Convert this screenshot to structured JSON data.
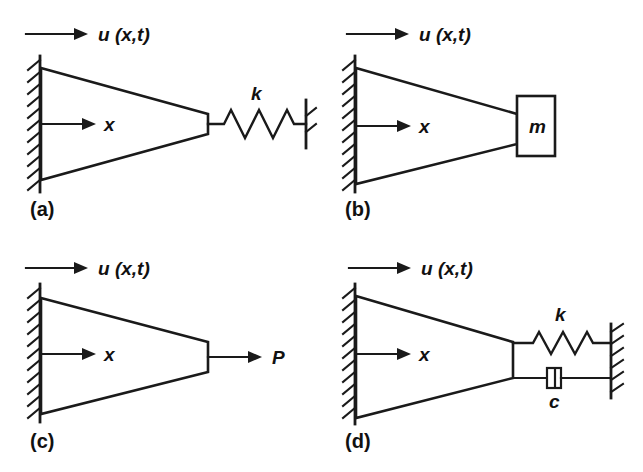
{
  "figure": {
    "background_color": "#ffffff",
    "line_color": "#1a1a1a",
    "panel_count": 4
  },
  "common": {
    "displacement_label": "u (x,t)",
    "axis_label": "x",
    "wall_name": "fixed-support-hatched-wall"
  },
  "panels": [
    {
      "id": "a",
      "caption": "(a)",
      "displacement_label": "u (x,t)",
      "axis_label": "x",
      "end_condition": "spring",
      "end_label": "k",
      "description": "Tapered bar fixed at left wall, spring of stiffness k connecting free end to ground"
    },
    {
      "id": "b",
      "caption": "(b)",
      "displacement_label": "u (x,t)",
      "axis_label": "x",
      "end_condition": "mass",
      "end_label": "m",
      "description": "Tapered bar fixed at left wall, lumped mass m attached at free end"
    },
    {
      "id": "c",
      "caption": "(c)",
      "displacement_label": "u (x,t)",
      "axis_label": "x",
      "end_condition": "force",
      "end_label": "P",
      "description": "Tapered bar fixed at left wall, axial force P applied at free end"
    },
    {
      "id": "d",
      "caption": "(d)",
      "displacement_label": "u (x,t)",
      "axis_label": "x",
      "end_condition": "spring-and-damper",
      "end_label_spring": "k",
      "end_label_damper": "c",
      "description": "Tapered bar fixed at left wall, spring k and viscous damper c connecting free end to a fixed wall"
    }
  ]
}
